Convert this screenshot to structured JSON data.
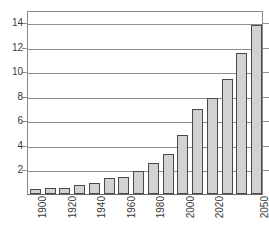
{
  "chart_data": {
    "type": "bar",
    "title_visible_fragment": "",
    "xlabel": "",
    "ylabel": "",
    "ylim": [
      0,
      15
    ],
    "grid": true,
    "grid_axis": "y",
    "legend": null,
    "categories": [
      "1900",
      "1910",
      "1920",
      "1930",
      "1940",
      "1950",
      "1960",
      "1970",
      "1980",
      "1990",
      "2000",
      "2010",
      "2020",
      "2030",
      "2040",
      "2050"
    ],
    "tick_labels_shown": [
      "1900",
      "1920",
      "1940",
      "1960",
      "1980",
      "2000",
      "2020",
      "2050"
    ],
    "values": [
      0.4,
      0.45,
      0.5,
      0.7,
      0.9,
      1.3,
      1.4,
      1.9,
      2.5,
      3.3,
      4.8,
      6.9,
      7.8,
      9.4,
      11.5,
      13.8
    ],
    "ytick_labels": [
      "2",
      "4",
      "6",
      "8",
      "10",
      "12",
      "14"
    ],
    "ytick_values": [
      2,
      4,
      6,
      8,
      10,
      12,
      14
    ],
    "bar_fill_color": "#d2d2d2",
    "bar_edge_color": "#4a4a4a",
    "grid_color": "#8f8f8f",
    "axis_color": "#6a6a6a"
  }
}
